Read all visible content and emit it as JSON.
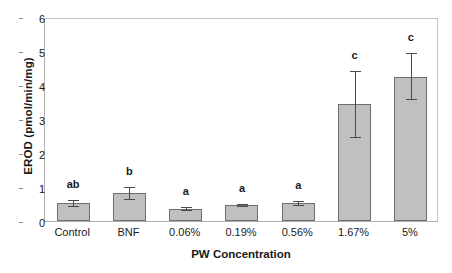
{
  "chart_data": {
    "type": "bar",
    "title": "",
    "xlabel": "PW Concentration",
    "ylabel": "EROD (pmol/min/mg)",
    "ylim": [
      0,
      6
    ],
    "ytick_labels": [
      "0",
      "1",
      "2",
      "3",
      "4",
      "5",
      "6"
    ],
    "ytick_values": [
      0,
      1,
      2,
      3,
      4,
      5,
      6
    ],
    "grid": false,
    "legend": "none",
    "categories": [
      "Control",
      "BNF",
      "0.06%",
      "0.19%",
      "0.56%",
      "1.67%",
      "5%"
    ],
    "values": [
      0.52,
      0.83,
      0.35,
      0.46,
      0.52,
      3.43,
      4.25
    ],
    "errors_upper": [
      0.62,
      0.99,
      0.4,
      0.51,
      0.6,
      4.42,
      4.95
    ],
    "errors_lower": [
      0.4,
      0.63,
      0.3,
      0.41,
      0.44,
      2.44,
      3.57
    ],
    "significance_labels": [
      "ab",
      "b",
      "a",
      "a",
      "a",
      "c",
      "c"
    ],
    "bar_fill_color": "#c0c0c0",
    "bar_edge_color": "#6e6e6e",
    "error_bar_color": "#4a4a4a",
    "axis_color": "#b0b0b0"
  }
}
